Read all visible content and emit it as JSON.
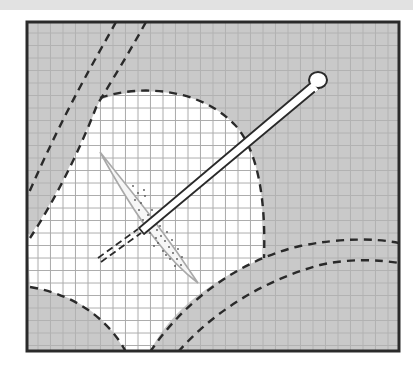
{
  "figure": {
    "colors": {
      "background": "#ffffff",
      "top_strip": "#e2e2e2",
      "frame_border": "#2a2a2a",
      "tissue_gray": "#c9c9c9",
      "grid_on_gray": "#b4b4b4",
      "grid_on_white": "#a9a9a9",
      "dashed_line": "#2a2a2a",
      "needle_outline": "#2a2a2a",
      "needle_fill": "#ffffff",
      "lesion_fill": "#f4f4f4",
      "stipple": "#555555"
    },
    "elements": {
      "frame": "frame",
      "grid": "grid",
      "highlight_region": "white-region",
      "lesion": "lesion",
      "needle": "needle",
      "dashed_boundaries": 6
    },
    "grid_spacing_px": 12.5
  }
}
